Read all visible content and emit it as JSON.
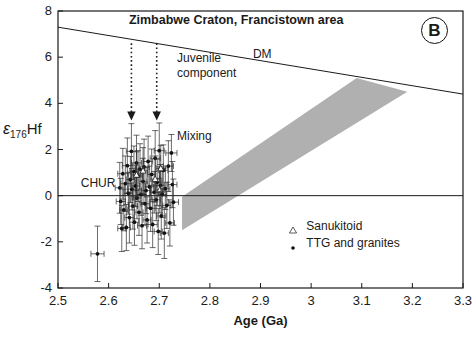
{
  "chart_data": {
    "type": "scatter",
    "title": "Zimbabwe Craton, Francistown area",
    "panel_label": "B",
    "xlabel": "Age (Ga)",
    "ylabel": "ε176Hf",
    "xlim": [
      2.5,
      3.3
    ],
    "ylim": [
      -4,
      8
    ],
    "xticks": [
      2.5,
      2.6,
      2.7,
      2.8,
      2.9,
      3.0,
      3.1,
      3.2,
      3.3
    ],
    "xticklabels": [
      "2.5",
      "2.6",
      "2.7",
      "2.8",
      "2.9",
      "3",
      "3.1",
      "3.2",
      "3.3"
    ],
    "yticks": [
      8,
      6,
      4,
      2,
      0,
      -2,
      -4
    ],
    "yticklabels": [
      "8",
      "6",
      "4",
      "2",
      "0",
      "-2",
      "-4"
    ],
    "grid": false,
    "legend_position": "lower right",
    "legend": [
      {
        "label": "Sanukitoid",
        "marker": "open-triangle"
      },
      {
        "label": "TTG and granites",
        "marker": "filled-dot"
      }
    ],
    "reference_lines": [
      {
        "name": "DM",
        "label": "DM",
        "type": "line",
        "x": [
          2.5,
          3.3
        ],
        "y": [
          7.3,
          4.4
        ]
      },
      {
        "name": "CHUR",
        "label": "CHUR",
        "type": "line",
        "x": [
          2.5,
          3.3
        ],
        "y": [
          0,
          0
        ]
      }
    ],
    "shaded_band": {
      "name": "mixing-array-band",
      "color": "#b0b0b0",
      "lower_edge": {
        "x": [
          2.745,
          3.19
        ],
        "y": [
          -1.5,
          4.5
        ]
      },
      "upper_edge": {
        "x": [
          2.745,
          3.09
        ],
        "y": [
          -0.05,
          5.1
        ]
      }
    },
    "annotations": [
      {
        "name": "juvenile-component",
        "text": "Juvenile\ncomponent",
        "x": 2.735,
        "y": 5.9
      },
      {
        "name": "mixing",
        "text": "Mixing",
        "x": 2.735,
        "y": 2.55
      },
      {
        "name": "chur-label",
        "text": "CHUR",
        "x": 2.545,
        "y": 0.5
      },
      {
        "name": "dm-label",
        "text": "DM",
        "x": 2.885,
        "y": 6.1
      }
    ],
    "arrows": [
      {
        "name": "arrow-juvenile-1",
        "x": 2.645,
        "y_start": 6.6,
        "y_end": 3.3,
        "style": "dotted-down"
      },
      {
        "name": "arrow-juvenile-2",
        "x": 2.695,
        "y_start": 6.6,
        "y_end": 3.3,
        "style": "dotted-down"
      }
    ],
    "series": [
      {
        "name": "TTG and granites",
        "marker": "filled-dot",
        "points": [
          {
            "x": 2.578,
            "y": -2.52,
            "xerr": 0.013,
            "yerr": 1.2
          },
          {
            "x": 2.622,
            "y": 0.34,
            "xerr": 0.009,
            "yerr": 1.1
          },
          {
            "x": 2.624,
            "y": -0.25,
            "xerr": 0.009,
            "yerr": 1.0
          },
          {
            "x": 2.626,
            "y": -1.42,
            "xerr": 0.008,
            "yerr": 1.0
          },
          {
            "x": 2.628,
            "y": 0.95,
            "xerr": 0.01,
            "yerr": 1.1
          },
          {
            "x": 2.63,
            "y": -0.62,
            "xerr": 0.008,
            "yerr": 0.9
          },
          {
            "x": 2.633,
            "y": 0.52,
            "xerr": 0.009,
            "yerr": 1.2
          },
          {
            "x": 2.635,
            "y": -1.38,
            "xerr": 0.008,
            "yerr": 1.0
          },
          {
            "x": 2.637,
            "y": 1.3,
            "xerr": 0.01,
            "yerr": 1.2
          },
          {
            "x": 2.639,
            "y": 0.1,
            "xerr": 0.008,
            "yerr": 0.9
          },
          {
            "x": 2.641,
            "y": -0.95,
            "xerr": 0.009,
            "yerr": 1.1
          },
          {
            "x": 2.643,
            "y": 0.7,
            "xerr": 0.008,
            "yerr": 1.0
          },
          {
            "x": 2.645,
            "y": 1.92,
            "xerr": 0.01,
            "yerr": 1.2
          },
          {
            "x": 2.646,
            "y": 0.28,
            "xerr": 0.008,
            "yerr": 0.9
          },
          {
            "x": 2.648,
            "y": -0.45,
            "xerr": 0.009,
            "yerr": 1.0
          },
          {
            "x": 2.65,
            "y": 1.05,
            "xerr": 0.008,
            "yerr": 1.1
          },
          {
            "x": 2.651,
            "y": -1.15,
            "xerr": 0.009,
            "yerr": 1.0
          },
          {
            "x": 2.653,
            "y": 0.42,
            "xerr": 0.008,
            "yerr": 0.9
          },
          {
            "x": 2.655,
            "y": 1.42,
            "xerr": 0.01,
            "yerr": 1.2
          },
          {
            "x": 2.656,
            "y": -0.1,
            "xerr": 0.008,
            "yerr": 0.9
          },
          {
            "x": 2.658,
            "y": 0.85,
            "xerr": 0.009,
            "yerr": 1.1
          },
          {
            "x": 2.66,
            "y": -0.72,
            "xerr": 0.008,
            "yerr": 1.0
          },
          {
            "x": 2.662,
            "y": 1.15,
            "xerr": 0.009,
            "yerr": 1.1
          },
          {
            "x": 2.664,
            "y": 0.05,
            "xerr": 0.008,
            "yerr": 0.9
          },
          {
            "x": 2.666,
            "y": -1.3,
            "xerr": 0.009,
            "yerr": 1.0
          },
          {
            "x": 2.668,
            "y": 0.62,
            "xerr": 0.008,
            "yerr": 1.0
          },
          {
            "x": 2.67,
            "y": 1.25,
            "xerr": 0.01,
            "yerr": 1.2
          },
          {
            "x": 2.672,
            "y": -0.35,
            "xerr": 0.008,
            "yerr": 0.9
          },
          {
            "x": 2.674,
            "y": 0.22,
            "xerr": 0.009,
            "yerr": 1.0
          },
          {
            "x": 2.676,
            "y": -1.05,
            "xerr": 0.008,
            "yerr": 1.0
          },
          {
            "x": 2.678,
            "y": 1.48,
            "xerr": 0.009,
            "yerr": 1.1
          },
          {
            "x": 2.681,
            "y": 0.38,
            "xerr": 0.008,
            "yerr": 0.9
          },
          {
            "x": 2.683,
            "y": -0.55,
            "xerr": 0.009,
            "yerr": 1.0
          },
          {
            "x": 2.685,
            "y": 0.92,
            "xerr": 0.008,
            "yerr": 1.1
          },
          {
            "x": 2.687,
            "y": -1.25,
            "xerr": 0.009,
            "yerr": 1.0
          },
          {
            "x": 2.69,
            "y": 0.15,
            "xerr": 0.008,
            "yerr": 0.9
          },
          {
            "x": 2.692,
            "y": 1.62,
            "xerr": 0.01,
            "yerr": 1.2
          },
          {
            "x": 2.694,
            "y": -0.18,
            "xerr": 0.008,
            "yerr": 0.9
          },
          {
            "x": 2.696,
            "y": 0.58,
            "xerr": 0.009,
            "yerr": 1.0
          },
          {
            "x": 2.698,
            "y": -1.55,
            "xerr": 0.008,
            "yerr": 1.0
          },
          {
            "x": 2.7,
            "y": 1.95,
            "xerr": 0.01,
            "yerr": 1.2
          },
          {
            "x": 2.702,
            "y": 0.45,
            "xerr": 0.008,
            "yerr": 0.9
          },
          {
            "x": 2.704,
            "y": -0.88,
            "xerr": 0.009,
            "yerr": 1.0
          },
          {
            "x": 2.706,
            "y": 0.05,
            "xerr": 0.008,
            "yerr": 1.0
          },
          {
            "x": 2.708,
            "y": 1.1,
            "xerr": 0.009,
            "yerr": 1.1
          },
          {
            "x": 2.71,
            "y": -1.62,
            "xerr": 0.008,
            "yerr": 1.1
          },
          {
            "x": 2.712,
            "y": 0.3,
            "xerr": 0.009,
            "yerr": 0.9
          },
          {
            "x": 2.715,
            "y": -0.42,
            "xerr": 0.008,
            "yerr": 1.0
          },
          {
            "x": 2.718,
            "y": 1.28,
            "xerr": 0.01,
            "yerr": 1.1
          },
          {
            "x": 2.721,
            "y": -1.18,
            "xerr": 0.009,
            "yerr": 1.0
          },
          {
            "x": 2.724,
            "y": 1.85,
            "xerr": 0.011,
            "yerr": 0.8
          },
          {
            "x": 2.726,
            "y": 0.48,
            "xerr": 0.009,
            "yerr": 1.0
          },
          {
            "x": 2.728,
            "y": -0.28,
            "xerr": 0.01,
            "yerr": 1.0
          }
        ]
      },
      {
        "name": "Sanukitoid",
        "marker": "open-triangle",
        "points": [
          {
            "x": 2.655,
            "y": 0.9,
            "xerr": 0.009,
            "yerr": 1.0
          },
          {
            "x": 2.668,
            "y": 1.08,
            "xerr": 0.009,
            "yerr": 1.0
          },
          {
            "x": 2.692,
            "y": 0.72,
            "xerr": 0.009,
            "yerr": 1.0
          },
          {
            "x": 2.701,
            "y": 0.25,
            "xerr": 0.009,
            "yerr": 1.0
          },
          {
            "x": 2.703,
            "y": 1.18,
            "xerr": 0.009,
            "yerr": 1.0
          }
        ]
      }
    ]
  }
}
